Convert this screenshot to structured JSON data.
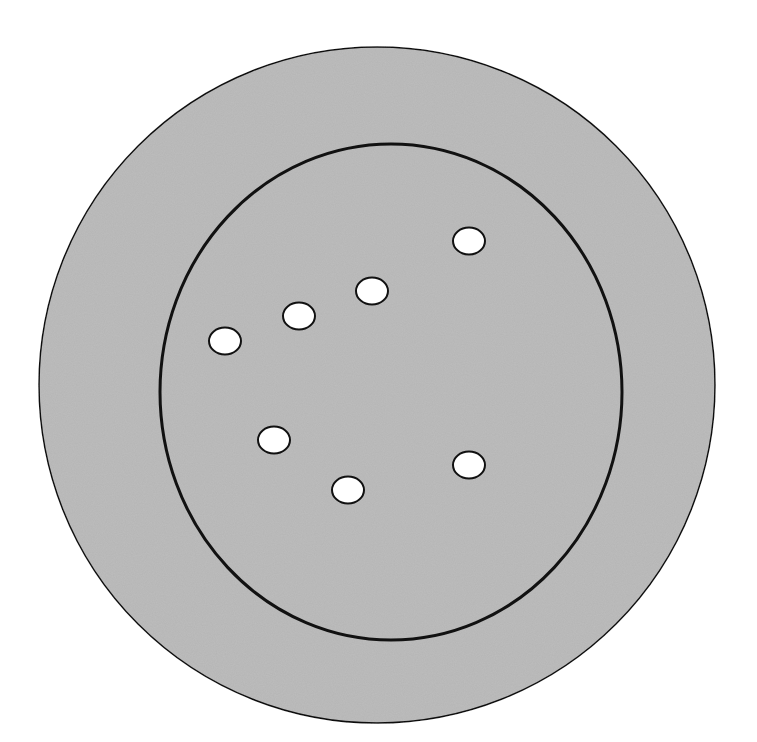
{
  "diagram": {
    "title": "",
    "colors": {
      "fill": "#bdbdbd",
      "stroke": "#111111",
      "hole": "#ffffff",
      "background": "#ffffff"
    },
    "outer_circle": {
      "cx": 377,
      "cy": 385,
      "r": 338
    },
    "inner_circle": {
      "cx": 391,
      "cy": 392,
      "rx": 231,
      "ry": 248
    },
    "holes": [
      {
        "cx": 469,
        "cy": 241
      },
      {
        "cx": 372,
        "cy": 291
      },
      {
        "cx": 299,
        "cy": 316
      },
      {
        "cx": 225,
        "cy": 341
      },
      {
        "cx": 274,
        "cy": 440
      },
      {
        "cx": 348,
        "cy": 490
      },
      {
        "cx": 469,
        "cy": 465
      }
    ],
    "hole_count": 7
  }
}
